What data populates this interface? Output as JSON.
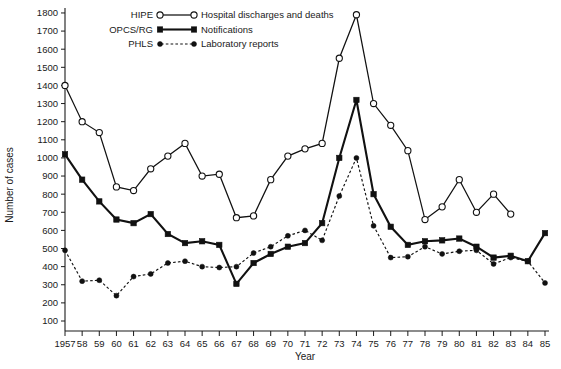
{
  "chart_data": {
    "type": "line",
    "title": "",
    "xlabel": "Year",
    "ylabel": "Number of cases",
    "xlim": [
      1957,
      1985
    ],
    "ylim": [
      0,
      1800
    ],
    "ytick_values": [
      100,
      200,
      300,
      400,
      500,
      600,
      700,
      800,
      900,
      1000,
      1100,
      1200,
      1300,
      1400,
      1500,
      1600,
      1700,
      1800
    ],
    "ytick_labels": [
      "100",
      "200",
      "300",
      "400",
      "500",
      "600",
      "700",
      "800",
      "900",
      "1000",
      "1100",
      "1200",
      "1300",
      "1400",
      "1500",
      "1600",
      "1700",
      "1800"
    ],
    "x": [
      1957,
      1958,
      1959,
      1960,
      1961,
      1962,
      1963,
      1964,
      1965,
      1966,
      1967,
      1968,
      1969,
      1970,
      1971,
      1972,
      1973,
      1974,
      1975,
      1976,
      1977,
      1978,
      1979,
      1980,
      1981,
      1982,
      1983,
      1984,
      1985
    ],
    "xtick_labels": [
      "1957",
      "58",
      "59",
      "60",
      "61",
      "62",
      "63",
      "64",
      "65",
      "66",
      "67",
      "68",
      "69",
      "70",
      "71",
      "72",
      "73",
      "74",
      "75",
      "76",
      "77",
      "78",
      "79",
      "80",
      "81",
      "82",
      "83",
      "84",
      "85"
    ],
    "grid": false,
    "legend_position": "top-center",
    "series": [
      {
        "name": "Hospital discharges and deaths",
        "source": "HIPE",
        "marker": "open-circle",
        "line_style": "solid",
        "values": [
          1400,
          1200,
          1140,
          840,
          820,
          940,
          1010,
          1080,
          900,
          910,
          670,
          680,
          880,
          1010,
          1050,
          1080,
          1550,
          1790,
          1300,
          1180,
          1040,
          660,
          730,
          880,
          700,
          800,
          690,
          null,
          null
        ]
      },
      {
        "name": "Notifications",
        "source": "OPCS/RG",
        "marker": "filled-square",
        "line_style": "solid-thick",
        "values": [
          1020,
          880,
          760,
          660,
          640,
          690,
          580,
          530,
          540,
          520,
          305,
          420,
          470,
          510,
          530,
          640,
          1000,
          1320,
          800,
          620,
          520,
          540,
          545,
          555,
          510,
          450,
          460,
          430,
          585
        ]
      },
      {
        "name": "Laboratory reports",
        "source": "PHLS",
        "marker": "filled-dot",
        "line_style": "dashed",
        "values": [
          490,
          320,
          325,
          240,
          345,
          360,
          420,
          430,
          400,
          395,
          400,
          475,
          510,
          570,
          600,
          545,
          790,
          1000,
          625,
          450,
          455,
          510,
          470,
          485,
          490,
          415,
          450,
          430,
          310
        ]
      }
    ],
    "legend": [
      {
        "source": "HIPE",
        "label": "Hospital discharges and deaths",
        "marker": "open-circle",
        "line_style": "solid"
      },
      {
        "source": "OPCS/RG",
        "label": "Notifications",
        "marker": "filled-square",
        "line_style": "solid-thick"
      },
      {
        "source": "PHLS",
        "label": "Laboratory reports",
        "marker": "filled-dot",
        "line_style": "dashed"
      }
    ]
  }
}
